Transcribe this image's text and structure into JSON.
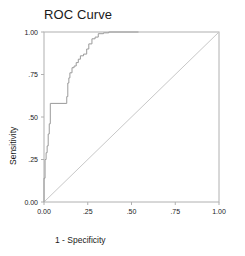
{
  "chart_data": {
    "type": "line",
    "title": "ROC Curve",
    "xlabel": "1 - Specificity",
    "ylabel": "Sensitivity",
    "xlim": [
      0,
      1
    ],
    "ylim": [
      0,
      1
    ],
    "grid": false,
    "legend": null,
    "xticks": [
      0,
      0.25,
      0.5,
      0.75,
      1
    ],
    "yticks": [
      0,
      0.25,
      0.5,
      0.75,
      1
    ],
    "xticklabels": [
      "0.00",
      ".25",
      ".50",
      ".75",
      "1.00"
    ],
    "yticklabels": [
      "0.00",
      ".25",
      ".50",
      ".75",
      "1.00"
    ],
    "series": [
      {
        "name": "ROC curve",
        "color": "#9a9a9a",
        "style": "step",
        "x": [
          0.0,
          0.0,
          0.006,
          0.006,
          0.012,
          0.012,
          0.018,
          0.018,
          0.024,
          0.024,
          0.03,
          0.03,
          0.036,
          0.036,
          0.13,
          0.13,
          0.136,
          0.136,
          0.142,
          0.142,
          0.148,
          0.148,
          0.16,
          0.16,
          0.172,
          0.172,
          0.184,
          0.184,
          0.196,
          0.196,
          0.208,
          0.208,
          0.226,
          0.226,
          0.244,
          0.244,
          0.256,
          0.256,
          0.274,
          0.274,
          0.292,
          0.292,
          0.31,
          0.31,
          0.34,
          0.34,
          0.37,
          0.37,
          0.54
        ],
        "y": [
          0.0,
          0.14,
          0.14,
          0.25,
          0.25,
          0.29,
          0.29,
          0.33,
          0.33,
          0.4,
          0.4,
          0.46,
          0.46,
          0.58,
          0.58,
          0.62,
          0.62,
          0.7,
          0.7,
          0.73,
          0.73,
          0.76,
          0.76,
          0.79,
          0.79,
          0.8,
          0.8,
          0.82,
          0.82,
          0.84,
          0.84,
          0.86,
          0.86,
          0.87,
          0.87,
          0.9,
          0.9,
          0.93,
          0.93,
          0.96,
          0.96,
          0.97,
          0.97,
          0.99,
          0.99,
          0.995,
          0.995,
          1.0,
          1.0
        ]
      },
      {
        "name": "reference-diagonal",
        "color": "#c8c8c8",
        "style": "line",
        "x": [
          0,
          1
        ],
        "y": [
          0,
          1
        ]
      }
    ]
  },
  "axes": {
    "frame_color": "#b0b0b0"
  }
}
